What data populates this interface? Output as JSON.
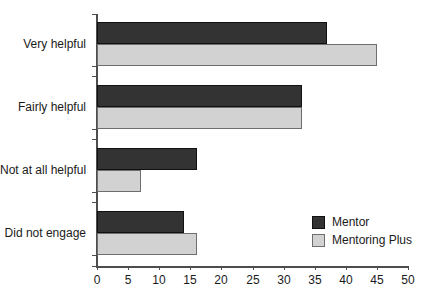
{
  "chart_data": {
    "type": "bar",
    "orientation": "horizontal",
    "title": "",
    "subtitle": "",
    "xlabel": "",
    "ylabel": "",
    "xlim": [
      0,
      50
    ],
    "xticks": [
      0,
      5,
      10,
      15,
      20,
      25,
      30,
      35,
      40,
      45,
      50
    ],
    "grid": false,
    "legend_position": "bottom-right",
    "categories": [
      "Very helpful",
      "Fairly helpful",
      "Not at all helpful",
      "Did not engage"
    ],
    "series": [
      {
        "name": "Mentor",
        "color": "#333333",
        "values": [
          37,
          33,
          16,
          14
        ]
      },
      {
        "name": "Mentoring Plus",
        "color": "#d2d2d2",
        "values": [
          45,
          33,
          7,
          16
        ]
      }
    ]
  },
  "legend": {
    "items": [
      {
        "label": "Mentor",
        "swatch": "dark"
      },
      {
        "label": "Mentoring Plus",
        "swatch": "light"
      }
    ]
  },
  "axis": {
    "x_tick_labels": [
      "0",
      "5",
      "10",
      "15",
      "20",
      "25",
      "30",
      "35",
      "40",
      "45",
      "50"
    ]
  },
  "colors": {
    "series_mentor": "#333333",
    "series_mentoring_plus": "#d2d2d2",
    "axis": "#4d4d4d",
    "text": "#1a1a1a",
    "background": "#ffffff"
  }
}
